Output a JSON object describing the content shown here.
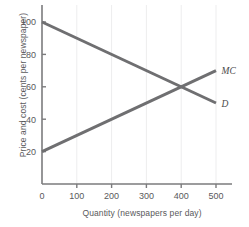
{
  "chart_data": {
    "type": "line",
    "title": "",
    "xlabel": "Quantity (newspapers per day)",
    "ylabel": "Price and cost (cents per newspaper)",
    "xlim": [
      0,
      540
    ],
    "ylim": [
      0,
      112
    ],
    "xticks": [
      0,
      100,
      200,
      300,
      400,
      500
    ],
    "xticklabels": [
      "0",
      "100",
      "200",
      "300",
      "400",
      "500"
    ],
    "yticks": [
      20,
      40,
      60,
      80,
      100
    ],
    "yticklabels": [
      "20",
      "40",
      "60",
      "80",
      "100"
    ],
    "grid": "faint-vertical",
    "legend_position": "inline-end-of-line",
    "line_color": "#6f6f71",
    "axis_color": "#7b7b7d",
    "series": [
      {
        "name": "D",
        "label": "D",
        "description": "Demand curve, downward sloping",
        "x": [
          0,
          500
        ],
        "values": [
          100,
          50
        ],
        "label_x": 510,
        "label_y": 50
      },
      {
        "name": "MC",
        "label": "MC",
        "description": "Marginal cost curve, upward sloping",
        "x": [
          0,
          500
        ],
        "values": [
          20,
          70
        ],
        "label_x": 510,
        "label_y": 70
      }
    ],
    "annotations": [
      {
        "name": "intersection",
        "x": 400,
        "y": 60,
        "text": ""
      }
    ]
  }
}
